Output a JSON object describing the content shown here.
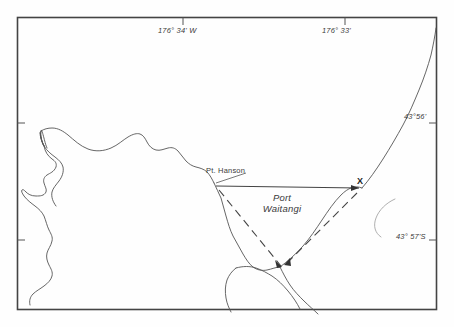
{
  "figure": {
    "type": "map",
    "background_color": "#ffffff",
    "line_color": "#555555",
    "frame_color": "#444444"
  },
  "graticule": {
    "longitude_labels": [
      {
        "id": "lon-176-34-w",
        "text": "176° 34' W",
        "x": 158,
        "y": 30,
        "tick_x": 183
      },
      {
        "id": "lon-176-33",
        "text": "176° 33'",
        "x": 322,
        "y": 30,
        "tick_x": 345
      }
    ],
    "latitude_labels": [
      {
        "id": "lat-43-56",
        "text": "43°56'",
        "x": 404,
        "y": 116,
        "tick_y": 123
      },
      {
        "id": "lat-43-57-s",
        "text": "43° 57'S",
        "x": 398,
        "y": 236,
        "tick_y": 240
      }
    ]
  },
  "features": {
    "place_labels": [
      {
        "id": "pt-hanson",
        "text": "Pt. Hanson",
        "x": 206,
        "y": 170
      }
    ],
    "water_labels": [
      {
        "id": "port-waitangi",
        "line1": "Port",
        "line2": "Waitangi",
        "x": 258,
        "y": 195
      }
    ],
    "station_markers": [
      {
        "id": "station-x",
        "text": "X",
        "x": 359,
        "y": 181
      }
    ]
  },
  "legend_notes": {
    "solid_line": "baseline between Pt. Hanson and station X",
    "dashed_lines": "sighting lines converging on shoreline point"
  }
}
